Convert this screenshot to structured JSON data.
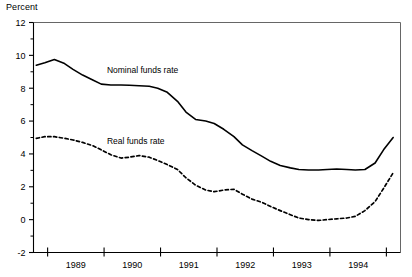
{
  "chart_data": {
    "type": "line",
    "title": "",
    "ylabel": "Percent",
    "xlabel": "",
    "ylim": [
      -2,
      12
    ],
    "xlim": [
      1988.25,
      1994.75
    ],
    "yticks": [
      12,
      10,
      8,
      6,
      4,
      2,
      0,
      -2
    ],
    "ytick_labels": [
      "12",
      "10",
      "8",
      "6",
      "4",
      "2",
      "0",
      "-2"
    ],
    "yminor_ticks": [
      11,
      9,
      7,
      5,
      3,
      1,
      -1
    ],
    "xticks": [
      1988.5,
      1989.5,
      1990.5,
      1991.5,
      1992.5,
      1993.5,
      1994.5
    ],
    "xtick_labels": [
      "1989",
      "1990",
      "1991",
      "1992",
      "1993",
      "1994"
    ],
    "xtick_label_positions": [
      1989,
      1990,
      1991,
      1992,
      1993,
      1994
    ],
    "grid": false,
    "legend_position": "inline-annotations",
    "series": [
      {
        "name": "Nominal funds rate",
        "style": "solid",
        "color": "#000000",
        "label_x": 1989.55,
        "label_y": 8.95,
        "x": [
          1988.3,
          1988.45,
          1988.62,
          1988.8,
          1988.95,
          1989.12,
          1989.3,
          1989.45,
          1989.62,
          1989.8,
          1989.95,
          1990.12,
          1990.3,
          1990.45,
          1990.62,
          1990.8,
          1990.95,
          1991.12,
          1991.3,
          1991.45,
          1991.62,
          1991.8,
          1991.95,
          1992.12,
          1992.3,
          1992.45,
          1992.62,
          1992.8,
          1992.95,
          1993.12,
          1993.3,
          1993.45,
          1993.62,
          1993.8,
          1993.95,
          1994.12,
          1994.3,
          1994.45,
          1994.62
        ],
        "y": [
          9.4,
          9.55,
          9.75,
          9.5,
          9.15,
          8.8,
          8.5,
          8.25,
          8.2,
          8.2,
          8.18,
          8.15,
          8.12,
          8.0,
          7.75,
          7.2,
          6.55,
          6.1,
          6.0,
          5.85,
          5.5,
          5.05,
          4.55,
          4.2,
          3.85,
          3.55,
          3.3,
          3.15,
          3.05,
          3.02,
          3.02,
          3.05,
          3.08,
          3.05,
          3.02,
          3.05,
          3.45,
          4.25,
          5.0
        ]
      },
      {
        "name": "Real funds rate",
        "style": "dashed",
        "color": "#000000",
        "label_x": 1989.55,
        "label_y": 4.6,
        "x": [
          1988.3,
          1988.45,
          1988.62,
          1988.8,
          1988.95,
          1989.12,
          1989.3,
          1989.45,
          1989.62,
          1989.8,
          1989.95,
          1990.12,
          1990.3,
          1990.45,
          1990.62,
          1990.8,
          1990.95,
          1991.12,
          1991.3,
          1991.45,
          1991.62,
          1991.8,
          1991.95,
          1992.12,
          1992.3,
          1992.45,
          1992.62,
          1992.8,
          1992.95,
          1993.12,
          1993.3,
          1993.45,
          1993.62,
          1993.8,
          1993.95,
          1994.12,
          1994.3,
          1994.45,
          1994.62
        ],
        "y": [
          4.95,
          5.05,
          5.05,
          4.95,
          4.85,
          4.7,
          4.5,
          4.25,
          3.95,
          3.75,
          3.8,
          3.9,
          3.8,
          3.6,
          3.35,
          3.05,
          2.55,
          2.1,
          1.8,
          1.7,
          1.8,
          1.85,
          1.55,
          1.25,
          1.05,
          0.8,
          0.55,
          0.3,
          0.1,
          0.0,
          -0.05,
          0.0,
          0.05,
          0.1,
          0.2,
          0.55,
          1.1,
          1.9,
          2.85
        ]
      }
    ]
  },
  "annotations": {
    "ylabel_title": "Percent"
  }
}
